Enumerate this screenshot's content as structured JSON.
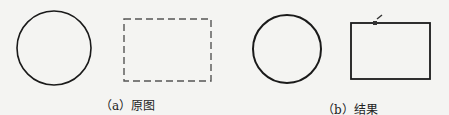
{
  "panels": [
    {
      "id": "a",
      "caption": "（a）原图",
      "shapes": [
        {
          "type": "circle",
          "cx": 54,
          "cy": 48,
          "r": 37,
          "stroke": "#1a1a1a",
          "style": "solid"
        },
        {
          "type": "rect",
          "x": 124,
          "y": 19,
          "width": 87,
          "height": 62,
          "stroke": "#555555",
          "style": "dashed"
        }
      ]
    },
    {
      "id": "b",
      "caption": "（b）结果",
      "shapes": [
        {
          "type": "circle",
          "cx": 287,
          "cy": 49,
          "r": 34,
          "stroke": "#1a1a1a",
          "style": "solid"
        },
        {
          "type": "rect",
          "x": 351,
          "y": 23,
          "width": 79,
          "height": 56,
          "stroke": "#1a1a1a",
          "style": "solid"
        }
      ],
      "grip_point": {
        "x": 375,
        "y": 23
      }
    }
  ]
}
